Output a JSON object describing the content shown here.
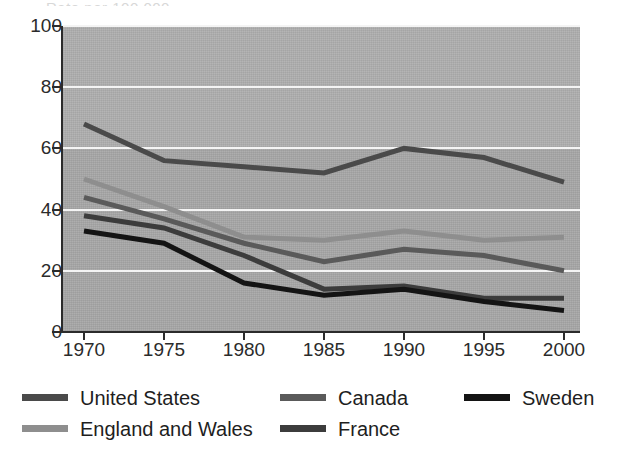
{
  "figure": {
    "cut_title_fragment": "Rate per 100,000"
  },
  "chart_data": {
    "type": "line",
    "title": "",
    "subtitle": "",
    "xlabel": "",
    "ylabel": "",
    "x": [
      1970,
      1975,
      1980,
      1985,
      1990,
      1995,
      2000
    ],
    "xtick_labels": [
      "1970",
      "1975",
      "1980",
      "1985",
      "1990",
      "1995",
      "2000"
    ],
    "ytick_labels": [
      "0",
      "20",
      "40",
      "60",
      "80",
      "100"
    ],
    "yticks": [
      0,
      20,
      40,
      60,
      80,
      100
    ],
    "ylim": [
      0,
      100
    ],
    "xlim": [
      1968.5,
      2001.5
    ],
    "grid": "horizontal",
    "legend_position": "below-axes",
    "plot_background": "#a8a8a8",
    "gridline_color": "#f4f4f4",
    "axis_color": "#2b2b2b",
    "series": [
      {
        "name": "United States",
        "color": "#4a4a4a",
        "values": [
          68,
          56,
          54,
          52,
          60,
          57,
          49
        ]
      },
      {
        "name": "Canada",
        "color": "#5a5a5a",
        "values": [
          44,
          37,
          29,
          23,
          27,
          25,
          20
        ]
      },
      {
        "name": "Sweden",
        "color": "#141414",
        "values": [
          33,
          29,
          16,
          12,
          14,
          10,
          7
        ]
      },
      {
        "name": "England and Wales",
        "color": "#8e8e8e",
        "values": [
          50,
          41,
          31,
          30,
          33,
          30,
          31
        ]
      },
      {
        "name": "France",
        "color": "#3c3c3c",
        "values": [
          38,
          34,
          25,
          14,
          15,
          11,
          11
        ]
      }
    ],
    "legend_rows": [
      [
        "United States",
        "Canada",
        "Sweden"
      ],
      [
        "England and Wales",
        "France"
      ]
    ]
  }
}
